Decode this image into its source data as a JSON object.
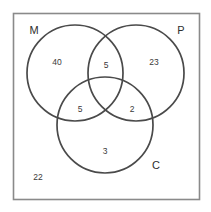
{
  "figure": {
    "type": "venn-diagram-3-set",
    "title": "",
    "background_color": "#ffffff",
    "universe": {
      "label": "",
      "border_color": "#8a8a8a"
    },
    "circle_color": "#4a4a4a",
    "text_color": "#3a3a3a"
  },
  "chart_data": {
    "type": "venn",
    "title": "",
    "sets": [
      {
        "key": "M",
        "label": "M",
        "label_x": 34,
        "label_y": 31,
        "cx": 75,
        "cy": 73,
        "r": 48
      },
      {
        "key": "P",
        "label": "P",
        "label_x": 181,
        "label_y": 31,
        "cx": 136,
        "cy": 73,
        "r": 48
      },
      {
        "key": "C",
        "label": "C",
        "label_x": 156,
        "label_y": 166,
        "cx": 105,
        "cy": 125,
        "r": 48
      }
    ],
    "regions": [
      {
        "key": "M_only",
        "label": "M only",
        "value": "40",
        "x": 57,
        "y": 63
      },
      {
        "key": "MP",
        "label": "M and P",
        "value": "5",
        "x": 106,
        "y": 66
      },
      {
        "key": "P_only",
        "label": "P only",
        "value": "23",
        "x": 154,
        "y": 63
      },
      {
        "key": "MC",
        "label": "M and C",
        "value": "5",
        "x": 80,
        "y": 110
      },
      {
        "key": "MPC",
        "label": "M and P and C",
        "value": "",
        "x": 105,
        "y": 98
      },
      {
        "key": "PC",
        "label": "P and C",
        "value": "2",
        "x": 132,
        "y": 110
      },
      {
        "key": "C_only",
        "label": "C only",
        "value": "3",
        "x": 105,
        "y": 152
      },
      {
        "key": "outside",
        "label": "Outside all sets",
        "value": "22",
        "x": 38,
        "y": 178
      }
    ]
  }
}
